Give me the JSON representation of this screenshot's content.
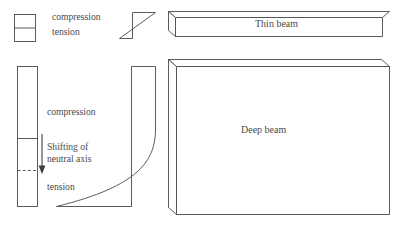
{
  "figure": {
    "background_color": "#ffffff",
    "line_color": "#4a4a4a",
    "text_color": "#4a4a4a",
    "width": 406,
    "height": 228
  },
  "top_row": {
    "section_box": {
      "name": "thin-beam-cross-section",
      "divider": "mid-height horizontal line separating compression zone from tension zone"
    },
    "labels": {
      "compression": "compression",
      "tension": "tension"
    },
    "stress_diagram": {
      "name": "linear-stress-profile",
      "shape": "Z-shaped linear bending stress distribution, zero at mid-depth neutral axis"
    },
    "beam": {
      "label": "Thin beam",
      "shape": "isometric rectangular prism, shallow depth"
    }
  },
  "bottom_row": {
    "section_box": {
      "name": "deep-beam-cross-section",
      "solid_divider": "original neutral axis",
      "dashed_divider": "shifted neutral axis"
    },
    "labels": {
      "compression": "compression",
      "shifting_line_1": "Shifting of",
      "shifting_line_2": "neutral axis",
      "tension": "tension"
    },
    "arrow": {
      "name": "neutral-axis-shift-arrow",
      "direction": "downward"
    },
    "stress_diagram": {
      "name": "nonlinear-stress-profile",
      "shape": "curved nonlinear bending stress distribution with small tension zone near bottom"
    },
    "beam": {
      "label": "Deep beam",
      "shape": "isometric rectangular prism, large depth"
    }
  }
}
